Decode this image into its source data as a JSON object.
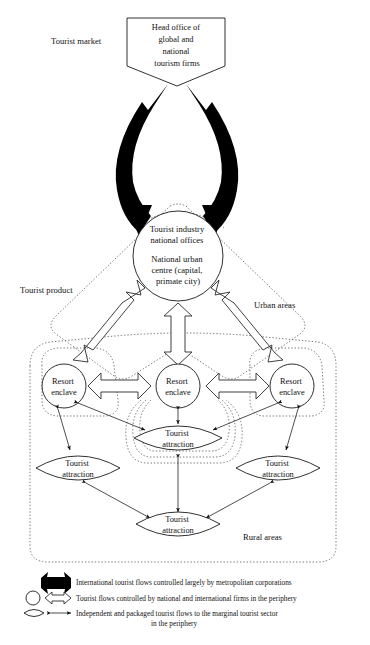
{
  "diagram": {
    "title_nodes": {
      "head_office": "Head office of\nglobal and\nnational\ntourism firms",
      "head_office_lines": [
        "Head office of",
        "global and",
        "national",
        "tourism firms"
      ],
      "capital_lines": [
        "Tourist industry",
        "national offices",
        "National urban",
        "centre (capital,",
        "primate city)"
      ],
      "resort_label_lines": [
        "Resort",
        "enclave"
      ],
      "attraction_label_lines": [
        "Tourist",
        "attraction"
      ]
    },
    "region_labels": {
      "tourist_market": "Tourist market",
      "tourist_product": "Tourist product",
      "urban_areas": "Urban areas",
      "rural_areas": "Rural areas"
    },
    "nodes": [
      {
        "id": "head-office",
        "kind": "pentagon",
        "lines": [
          "Head office of",
          "global and",
          "national",
          "tourism firms"
        ]
      },
      {
        "id": "capital-city",
        "kind": "circle",
        "lines": [
          "Tourist industry",
          "national offices",
          "National urban",
          "centre (capital,",
          "primate city)"
        ]
      },
      {
        "id": "resort-enclave-left",
        "kind": "circle",
        "lines": [
          "Resort",
          "enclave"
        ]
      },
      {
        "id": "resort-enclave-centre",
        "kind": "circle",
        "lines": [
          "Resort",
          "enclave"
        ]
      },
      {
        "id": "resort-enclave-right",
        "kind": "circle",
        "lines": [
          "Resort",
          "enclave"
        ]
      },
      {
        "id": "attraction-centre",
        "kind": "lens",
        "lines": [
          "Tourist",
          "attraction"
        ]
      },
      {
        "id": "attraction-left",
        "kind": "lens",
        "lines": [
          "Tourist",
          "attraction"
        ]
      },
      {
        "id": "attraction-right",
        "kind": "lens",
        "lines": [
          "Tourist",
          "attraction"
        ]
      },
      {
        "id": "attraction-bottom",
        "kind": "lens",
        "lines": [
          "Tourist",
          "attraction"
        ]
      }
    ],
    "legend": [
      {
        "symbol": "thick-black-block-arrow",
        "text": "International tourist flows controlled largely by metropolitan corporations"
      },
      {
        "symbol": "circle-and-hollow-block-arrow",
        "text": "Tourist flows controlled by national and international firms in the periphery"
      },
      {
        "symbol": "lens-and-thin-double-arrow",
        "text": "Independent and packaged tourist flows to the marginal tourist sector",
        "text2": "in the periphery"
      }
    ],
    "colors": {
      "ink": "#111111",
      "solid_flow": "#000000",
      "outline": "#1a1a1a",
      "dotted_region": "#555555",
      "background": "#ffffff"
    }
  }
}
